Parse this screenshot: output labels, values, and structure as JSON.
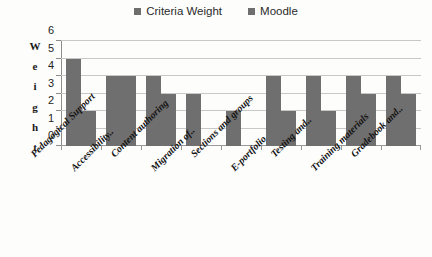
{
  "chart_data": {
    "type": "bar",
    "title": "",
    "xlabel": "",
    "ylabel": "Weight",
    "ylim": [
      0,
      6
    ],
    "yticks": [
      0,
      1,
      2,
      3,
      4,
      5,
      6
    ],
    "grid": true,
    "legend_position": "top-center",
    "categories": [
      "Pedagogical Support",
      "Accessibility..",
      "Content authoring",
      "Migration of..",
      "Sections and groups",
      "E-portfolio",
      "Testing and..",
      "Training materials",
      "Gradebook and.."
    ],
    "series": [
      {
        "name": "Criteria Weight",
        "values": [
          5,
          4,
          4,
          3,
          2,
          4,
          4,
          4,
          4
        ]
      },
      {
        "name": "Moodle",
        "values": [
          2,
          4,
          3,
          0,
          0,
          2,
          2,
          3,
          3
        ]
      }
    ]
  },
  "legend": {
    "entries": [
      {
        "label": "Criteria Weight",
        "color": "#6f6e6e"
      },
      {
        "label": "Moodle",
        "color": "#6f6e6e"
      }
    ]
  },
  "axis": {
    "y_title_letters": [
      "W",
      "e",
      "i",
      "g",
      "h",
      "t"
    ],
    "y_tick_labels": [
      "6",
      "5",
      "4",
      "3",
      "2",
      "1",
      "0"
    ]
  },
  "colors": {
    "bar_fill": "#706f6f",
    "gridline": "#c8c8c8",
    "axis_line": "#8d8d8d",
    "background": "#fdfdfc",
    "text": "#1f1f1f"
  }
}
